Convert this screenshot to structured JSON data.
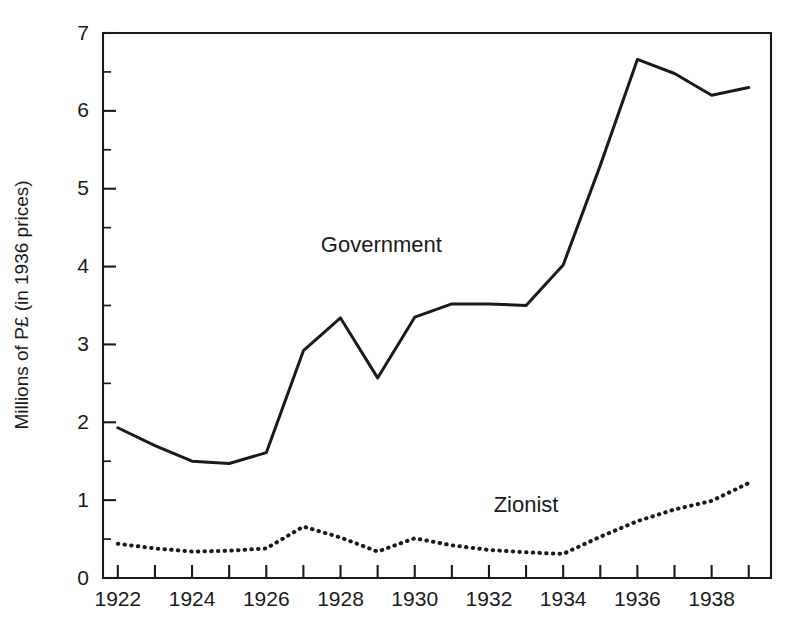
{
  "chart_data": {
    "type": "line",
    "title": "",
    "xlabel": "",
    "ylabel": "Millions of P£ (in 1936 prices)",
    "x": [
      1922,
      1923,
      1924,
      1925,
      1926,
      1927,
      1928,
      1929,
      1930,
      1931,
      1932,
      1933,
      1934,
      1935,
      1936,
      1937,
      1938,
      1939
    ],
    "xlim": [
      1921.6,
      1939.6
    ],
    "ylim": [
      0,
      7
    ],
    "grid": false,
    "legend_position": "inline-annotations",
    "x_tick_labels": [
      "1922",
      "1924",
      "1926",
      "1928",
      "1930",
      "1932",
      "1934",
      "1936",
      "1938"
    ],
    "x_tick_label_years": [
      1922,
      1924,
      1926,
      1928,
      1930,
      1932,
      1934,
      1936,
      1938
    ],
    "x_minor_tick_years": [
      1923,
      1925,
      1927,
      1929,
      1931,
      1933,
      1935,
      1937,
      1939
    ],
    "y_tick_labels": [
      "0",
      "1",
      "2",
      "3",
      "4",
      "5",
      "6",
      "7"
    ],
    "y_tick_values": [
      0,
      1,
      2,
      3,
      4,
      5,
      6,
      7
    ],
    "y_minor_tick_values": [
      0.5,
      1.5,
      2.5,
      3.5,
      4.5,
      5.5,
      6.5
    ],
    "series": [
      {
        "name": "Government",
        "style": "solid",
        "color": "#1a1a1a",
        "label_x": 1929.1,
        "label_y": 4.26,
        "values": [
          1.93,
          1.7,
          1.5,
          1.47,
          1.61,
          2.92,
          3.34,
          2.57,
          3.35,
          3.52,
          3.52,
          3.5,
          4.02,
          5.3,
          6.66,
          6.48,
          6.2,
          6.3
        ]
      },
      {
        "name": "Zionist",
        "style": "dotted",
        "color": "#1a1a1a",
        "label_x": 1933.0,
        "label_y": 0.92,
        "values": [
          0.44,
          0.38,
          0.34,
          0.35,
          0.38,
          0.66,
          0.52,
          0.34,
          0.51,
          0.42,
          0.36,
          0.33,
          0.31,
          0.53,
          0.73,
          0.88,
          0.99,
          1.22
        ]
      }
    ]
  },
  "axis": {
    "y_title": "Millions of P£ (in 1936 prices)"
  }
}
